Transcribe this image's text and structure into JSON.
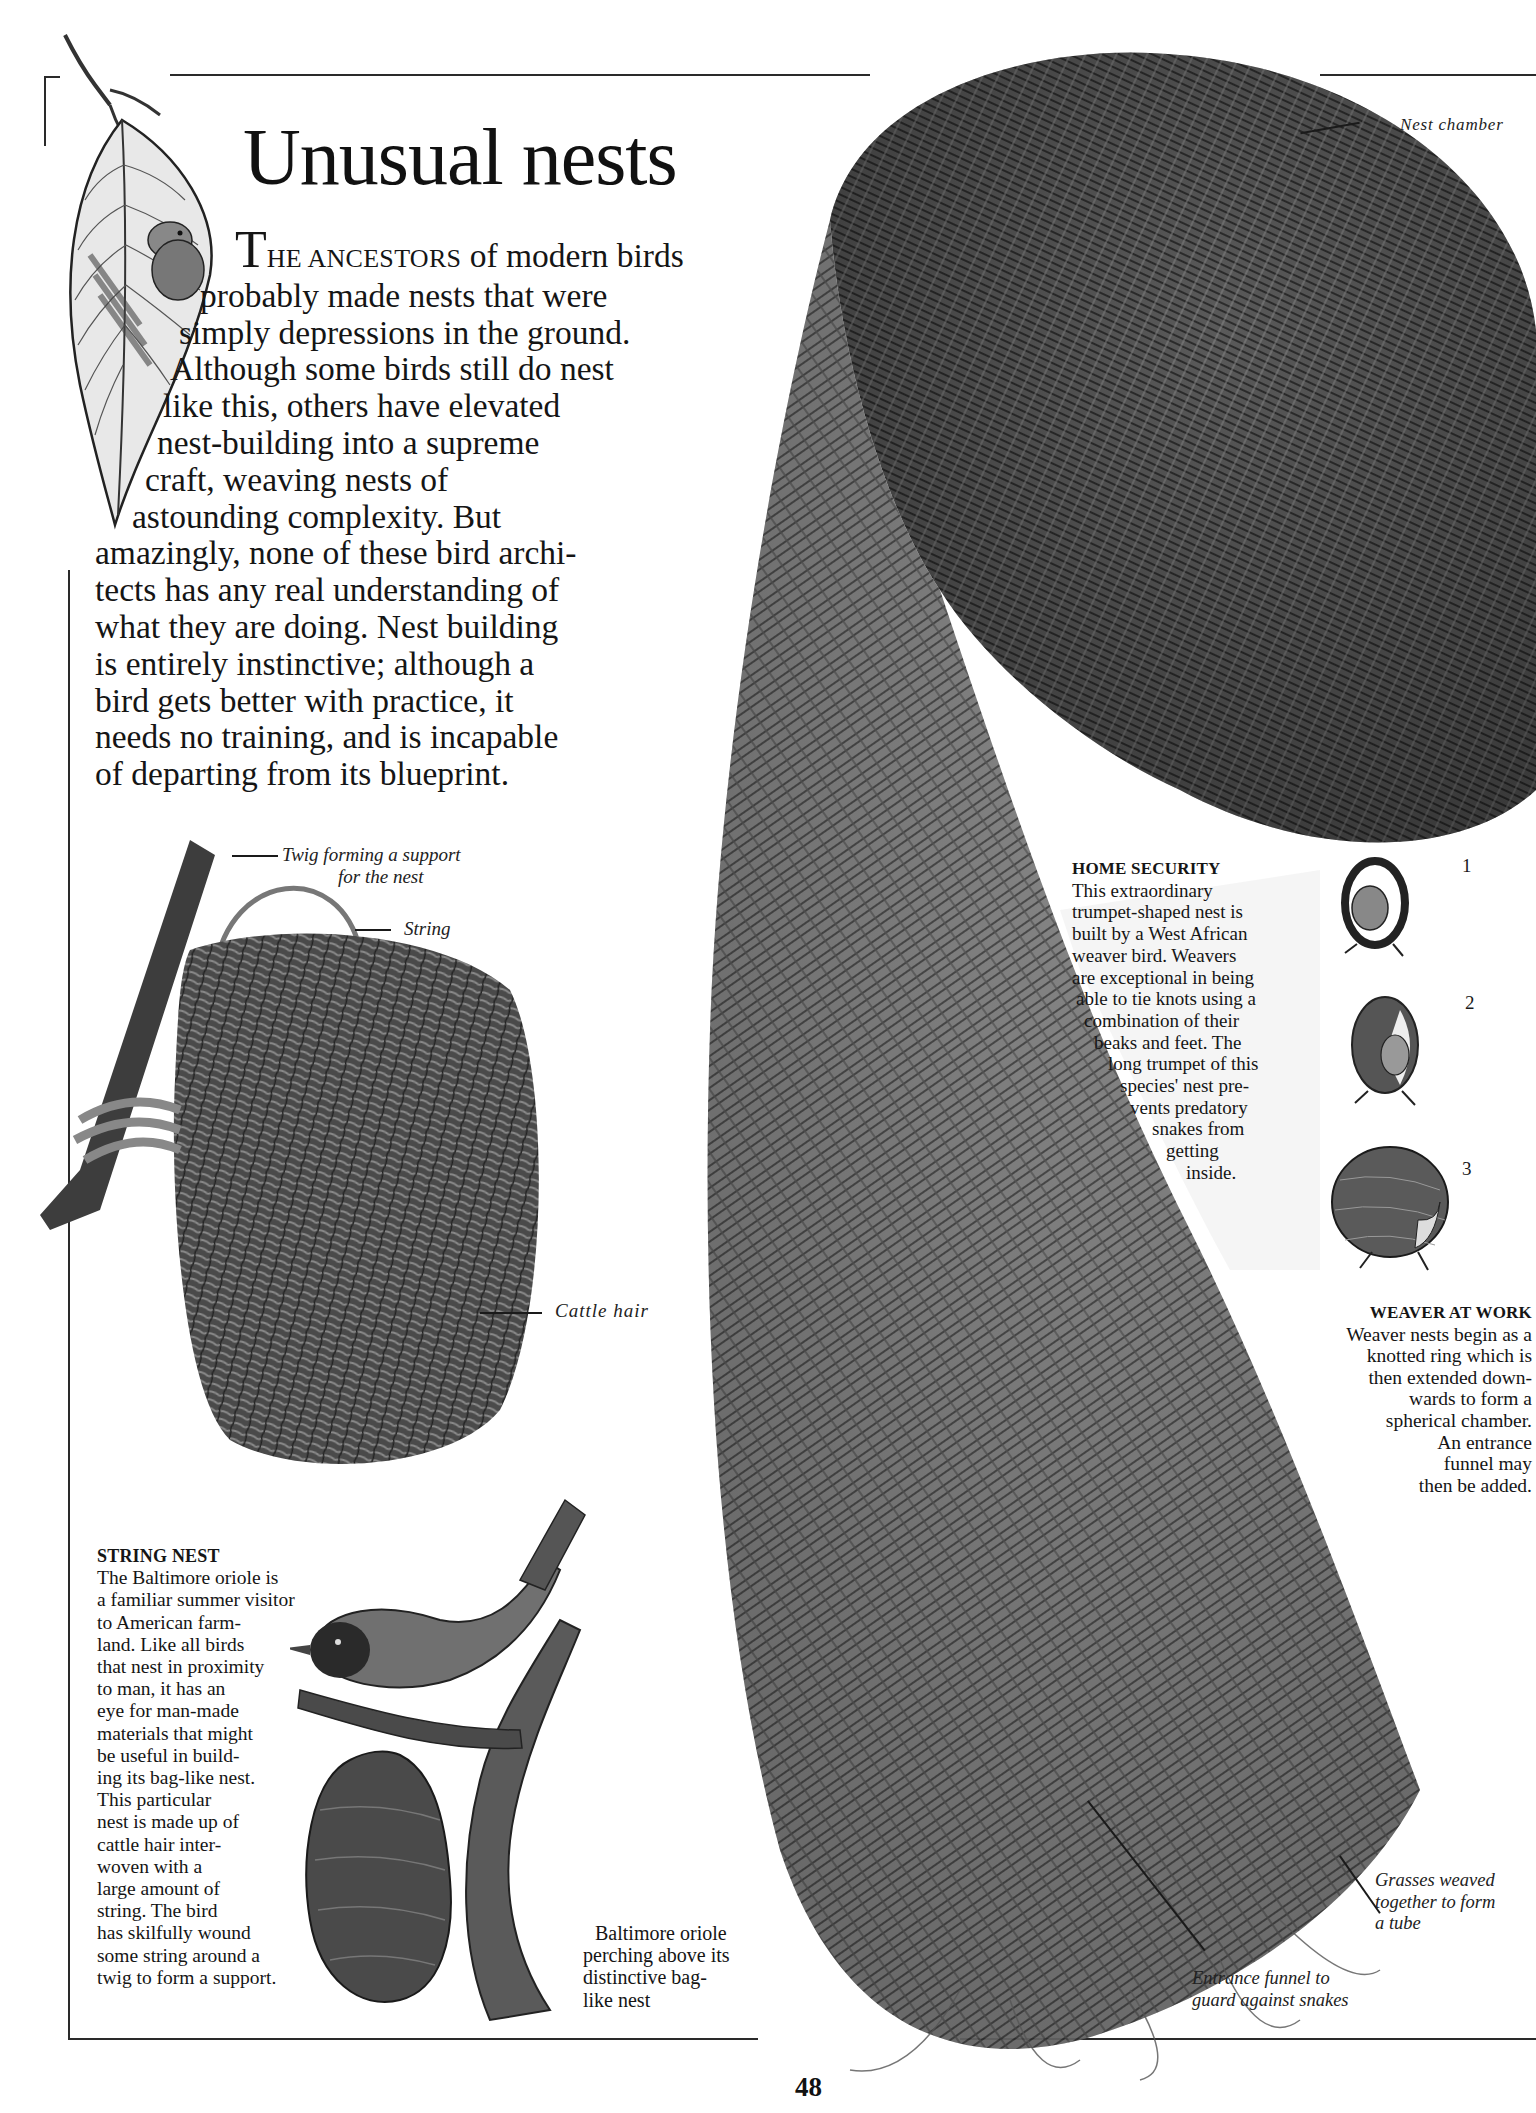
{
  "page": {
    "title": "Unusual nests",
    "page_number": "48"
  },
  "intro": {
    "dropcap": "T",
    "smallcaps_lead": "HE ANCESTORS",
    "lines": [
      " of modern birds",
      "probably made nests that were",
      "simply depressions in the ground.",
      "Although some birds still do nest",
      "like this, others have elevated",
      "nest-building into a supreme",
      "craft, weaving nests of",
      "astounding complexity. But",
      "amazingly, none of these bird archi-",
      "tects has any real understanding of",
      "what they are doing. Nest building",
      "is entirely instinctive; although a",
      "bird gets better with practice, it",
      "needs no training, and is incapable",
      "of departing from its blueprint."
    ]
  },
  "labels": {
    "twig_support_line1": "Twig forming a support",
    "twig_support_line2": "for the nest",
    "string": "String",
    "cattle_hair": "Cattle hair",
    "nest_chamber": "Nest chamber",
    "grasses_line1": "Grasses weaved",
    "grasses_line2": "together to form",
    "grasses_line3": "a tube",
    "funnel_line1": "Entrance funnel to",
    "funnel_line2": "guard against snakes"
  },
  "string_nest": {
    "heading": "STRING NEST",
    "lines": [
      "The Baltimore oriole is",
      "a familiar summer visitor",
      "to American farm-",
      "land. Like all birds",
      "that nest in proximity",
      "to man, it has an",
      "eye for man-made",
      "materials that might",
      "be useful in build-",
      "ing its bag-like nest.",
      "This particular",
      "nest is made up of",
      "cattle hair inter-",
      "woven with a",
      "large amount of",
      "string. The bird",
      "has skilfully wound",
      "some string around a",
      "twig to form a support."
    ]
  },
  "oriole_caption": {
    "lines": [
      "Baltimore oriole",
      "perching above its",
      "distinctive bag-",
      "like nest"
    ]
  },
  "home_security": {
    "heading": "HOME SECURITY",
    "lines": [
      "This extraordinary",
      "trumpet-shaped nest is",
      "built by a West African",
      "weaver bird. Weavers",
      "are exceptional in being",
      "able to tie knots using a",
      "combination of their",
      "beaks and feet. The",
      "long trumpet of this",
      "species' nest pre-",
      "vents predatory",
      "snakes from",
      "getting",
      "inside."
    ]
  },
  "weaver_at_work": {
    "heading": "WEAVER AT WORK",
    "lines": [
      "Weaver nests begin as a",
      "knotted ring which is",
      "then extended down-",
      "wards to form a",
      "spherical chamber.",
      "An entrance",
      "funnel may",
      "then be added."
    ],
    "steps": [
      "1",
      "2",
      "3"
    ]
  },
  "colors": {
    "ink": "#151515",
    "paper": "#ffffff",
    "nest_dark": "#3a3a3a",
    "nest_mid": "#6a6a6a"
  }
}
